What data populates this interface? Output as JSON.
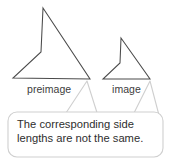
{
  "figure": {
    "type": "geometry-diagram",
    "topic": "dilation / similarity comparison",
    "shapes": [
      {
        "name": "preimage",
        "label": "preimage",
        "kind": "dart-quadrilateral",
        "stroke_color": "#4a4a4a",
        "vertices": [
          [
            43,
            8
          ],
          [
            90,
            79
          ],
          [
            13,
            78
          ],
          [
            41,
            52
          ]
        ]
      },
      {
        "name": "image",
        "label": "image",
        "kind": "dart-quadrilateral",
        "stroke_color": "#4a4a4a",
        "vertices": [
          [
            121,
            38
          ],
          [
            150,
            79
          ],
          [
            103,
            79
          ],
          [
            120,
            63
          ]
        ]
      }
    ]
  },
  "labels": {
    "preimage": "preimage",
    "image": "image"
  },
  "callout": {
    "line1": "The corresponding side",
    "line2": "lengths are not the same.",
    "fill_color": "#ffffff",
    "border_color": "#cfcfcf",
    "text_color": "#2e2e2e"
  }
}
